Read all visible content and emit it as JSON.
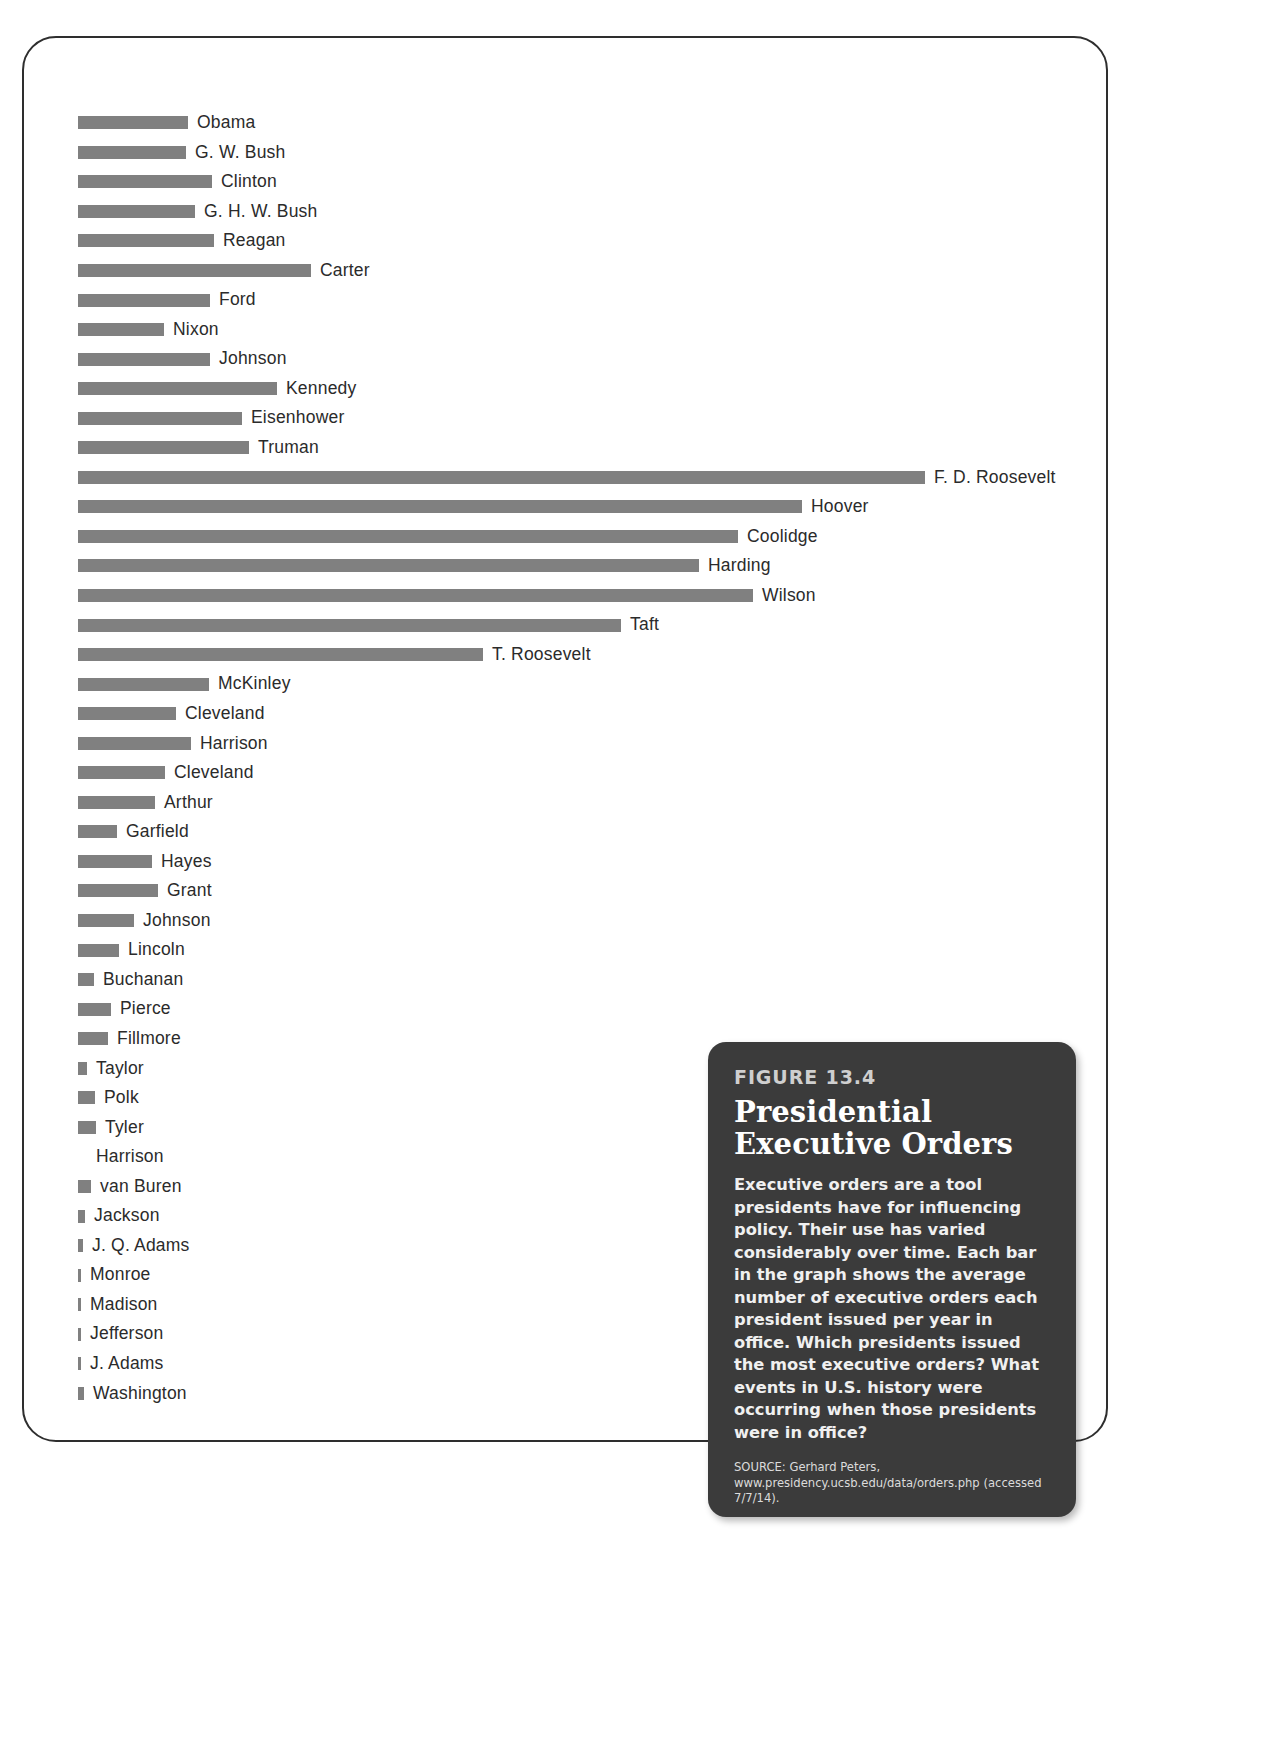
{
  "figure": {
    "number_label": "FIGURE 13.4",
    "body": "Executive orders are a tool presidents have for influencing policy. Their use has varied considerably over time. Each bar in the graph shows the average number of executive orders each president issued per year in office. Which presidents issued the most executive orders? What events in U.S. history were occurring when those presidents were in office?",
    "source": "SOURCE: Gerhard Peters, www.presidency.ucsb.edu/data/orders.php (accessed 7/7/14).",
    "card_background": "#3b3b3b",
    "bar_color": "#808080",
    "frame_color": "#2e2e2e"
  },
  "chart_data": {
    "type": "bar",
    "orientation": "horizontal",
    "xlabel": "Average number of executive orders issued per year in office",
    "ylabel": "President",
    "grid": false,
    "legend": "none",
    "xlim": [
      0,
      220
    ],
    "value_unit": "executive orders per year",
    "note": "Bar lengths read off the figure; values are average executive orders issued per year in office.",
    "categories": [
      "Obama",
      "G. W. Bush",
      "Clinton",
      "G. H. W. Bush",
      "Reagan",
      "Carter",
      "Ford",
      "Nixon",
      "Johnson",
      "Kennedy",
      "Eisenhower",
      "Truman",
      "F. D. Roosevelt",
      "Hoover",
      "Coolidge",
      "Harding",
      "Wilson",
      "Taft",
      "T. Roosevelt",
      "McKinley",
      "Cleveland",
      "Harrison",
      "Cleveland",
      "Arthur",
      "Garfield",
      "Hayes",
      "Grant",
      "Johnson",
      "Lincoln",
      "Buchanan",
      "Pierce",
      "Fillmore",
      "Taylor",
      "Polk",
      "Tyler",
      "Harrison",
      "van Buren",
      "Jackson",
      "J. Q. Adams",
      "Monroe",
      "Madison",
      "Jefferson",
      "J. Adams",
      "Washington"
    ],
    "values": [
      34,
      36,
      46,
      42,
      47,
      59,
      45,
      27,
      45,
      75,
      60,
      62,
      203,
      178,
      158,
      150,
      162,
      124,
      96,
      43,
      34,
      38,
      29,
      26,
      15,
      25,
      27,
      18,
      15,
      6,
      9,
      9,
      4,
      6,
      7,
      0,
      5,
      3,
      2,
      1,
      1,
      1,
      1,
      2
    ],
    "bar_pixel_lengths": [
      110,
      108,
      134,
      117,
      136,
      233,
      132,
      86,
      132,
      199,
      164,
      171,
      847,
      724,
      660,
      621,
      675,
      543,
      405,
      131,
      98,
      113,
      87,
      77,
      39,
      74,
      80,
      56,
      41,
      16,
      33,
      30,
      9,
      17,
      18,
      0,
      13,
      7,
      5,
      3,
      3,
      3,
      3,
      6
    ],
    "bars": [
      {
        "label": "Obama",
        "value": 34,
        "px": 110
      },
      {
        "label": "G. W. Bush",
        "value": 36,
        "px": 108
      },
      {
        "label": "Clinton",
        "value": 46,
        "px": 134
      },
      {
        "label": "G. H. W. Bush",
        "value": 42,
        "px": 117
      },
      {
        "label": "Reagan",
        "value": 47,
        "px": 136
      },
      {
        "label": "Carter",
        "value": 59,
        "px": 233
      },
      {
        "label": "Ford",
        "value": 45,
        "px": 132
      },
      {
        "label": "Nixon",
        "value": 27,
        "px": 86
      },
      {
        "label": "Johnson",
        "value": 45,
        "px": 132
      },
      {
        "label": "Kennedy",
        "value": 75,
        "px": 199
      },
      {
        "label": "Eisenhower",
        "value": 60,
        "px": 164
      },
      {
        "label": "Truman",
        "value": 62,
        "px": 171
      },
      {
        "label": "F. D. Roosevelt",
        "value": 203,
        "px": 847
      },
      {
        "label": "Hoover",
        "value": 178,
        "px": 724
      },
      {
        "label": "Coolidge",
        "value": 158,
        "px": 660
      },
      {
        "label": "Harding",
        "value": 150,
        "px": 621
      },
      {
        "label": "Wilson",
        "value": 162,
        "px": 675
      },
      {
        "label": "Taft",
        "value": 124,
        "px": 543
      },
      {
        "label": "T. Roosevelt",
        "value": 96,
        "px": 405
      },
      {
        "label": "McKinley",
        "value": 43,
        "px": 131
      },
      {
        "label": "Cleveland",
        "value": 34,
        "px": 98
      },
      {
        "label": "Harrison",
        "value": 38,
        "px": 113
      },
      {
        "label": "Cleveland",
        "value": 29,
        "px": 87
      },
      {
        "label": "Arthur",
        "value": 26,
        "px": 77
      },
      {
        "label": "Garfield",
        "value": 15,
        "px": 39
      },
      {
        "label": "Hayes",
        "value": 25,
        "px": 74
      },
      {
        "label": "Grant",
        "value": 27,
        "px": 80
      },
      {
        "label": "Johnson",
        "value": 18,
        "px": 56
      },
      {
        "label": "Lincoln",
        "value": 15,
        "px": 41
      },
      {
        "label": "Buchanan",
        "value": 6,
        "px": 16
      },
      {
        "label": "Pierce",
        "value": 9,
        "px": 33
      },
      {
        "label": "Fillmore",
        "value": 9,
        "px": 30
      },
      {
        "label": "Taylor",
        "value": 4,
        "px": 9
      },
      {
        "label": "Polk",
        "value": 6,
        "px": 17
      },
      {
        "label": "Tyler",
        "value": 7,
        "px": 18
      },
      {
        "label": "Harrison",
        "value": 0,
        "px": 0
      },
      {
        "label": "van Buren",
        "value": 5,
        "px": 13
      },
      {
        "label": "Jackson",
        "value": 3,
        "px": 7
      },
      {
        "label": "J. Q. Adams",
        "value": 2,
        "px": 5
      },
      {
        "label": "Monroe",
        "value": 1,
        "px": 3
      },
      {
        "label": "Madison",
        "value": 1,
        "px": 3
      },
      {
        "label": "Jefferson",
        "value": 1,
        "px": 3
      },
      {
        "label": "J. Adams",
        "value": 1,
        "px": 3
      },
      {
        "label": "Washington",
        "value": 2,
        "px": 6
      }
    ]
  }
}
